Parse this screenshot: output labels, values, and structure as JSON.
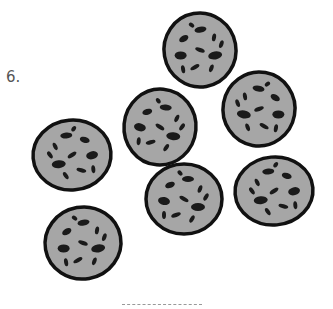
{
  "problem": {
    "number_label": "6.",
    "item": "cookie",
    "count": 7,
    "answer_line": ""
  },
  "colors": {
    "cookie_fill": "#a6a6a6",
    "cookie_outline": "#111111",
    "chip": "#1a1a1a"
  },
  "cookies": [
    {
      "cx": 200,
      "cy": 50,
      "rx": 36,
      "ry": 37,
      "rot": -10
    },
    {
      "cx": 259,
      "cy": 109,
      "rx": 36,
      "ry": 37,
      "rot": 10
    },
    {
      "cx": 160,
      "cy": 127,
      "rx": 36,
      "ry": 38,
      "rot": 5
    },
    {
      "cx": 72,
      "cy": 155,
      "rx": 39,
      "ry": 35,
      "rot": -5
    },
    {
      "cx": 184,
      "cy": 199,
      "rx": 38,
      "ry": 35,
      "rot": 0
    },
    {
      "cx": 274,
      "cy": 191,
      "rx": 39,
      "ry": 34,
      "rot": -5
    },
    {
      "cx": 83,
      "cy": 243,
      "rx": 38,
      "ry": 36,
      "rot": -10
    }
  ]
}
